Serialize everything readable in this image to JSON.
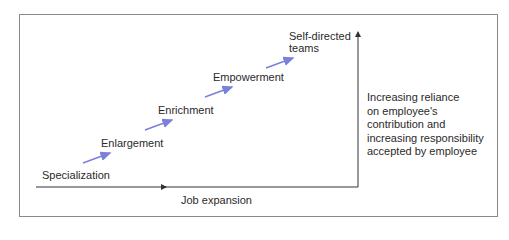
{
  "diagram": {
    "title": "",
    "stages": [
      {
        "label": "Specialization"
      },
      {
        "label": "Enlargement"
      },
      {
        "label": "Enrichment"
      },
      {
        "label": "Empowerment"
      },
      {
        "label_line1": "Self-directed",
        "label_line2": "teams"
      }
    ],
    "x_axis_label": "Job expansion",
    "y_axis_description": "Increasing reliance on employee's contribution and increasing responsibility accepted by employee",
    "y_axis_lines": [
      "Increasing reliance",
      "on employee's",
      "contribution and",
      "increasing responsibility",
      "accepted by employee"
    ],
    "colors": {
      "stage_arrow": "#7b80d8",
      "axis": "#333333",
      "frame": "#8a8a8a"
    }
  }
}
